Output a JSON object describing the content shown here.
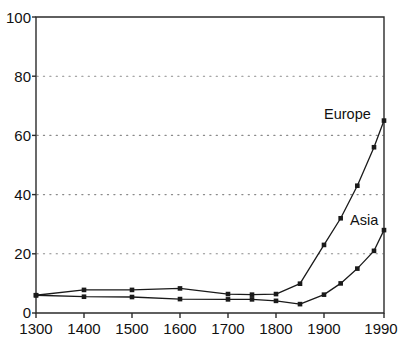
{
  "chart_data": {
    "type": "line",
    "title": "",
    "subtitle": "",
    "xlabel": "",
    "ylabel": "",
    "xlim": [
      1300,
      1990
    ],
    "ylim": [
      0,
      100
    ],
    "grid": "horizontal-dotted",
    "gridlines_y": [
      20,
      40,
      60,
      80
    ],
    "legend_position": "inline-right-end-of-line",
    "xticks": [
      1300,
      1400,
      1500,
      1600,
      1700,
      1800,
      1900,
      1990
    ],
    "xticklabels": [
      "1300",
      "1400",
      "1500",
      "1600",
      "1700",
      "1800",
      "1900",
      "1990"
    ],
    "yticks": [
      0,
      20,
      40,
      60,
      80,
      100
    ],
    "yticklabels": [
      "0",
      "20",
      "40",
      "60",
      "80",
      "100"
    ],
    "annotations": [
      {
        "text": "Europe",
        "x": 1963,
        "y": 66
      },
      {
        "text": "Asia",
        "x": 1962,
        "y": 31
      }
    ],
    "series": [
      {
        "name": "Europe",
        "color": "#1a1a1a",
        "marker": "filled-square",
        "x": [
          1300,
          1400,
          1500,
          1600,
          1700,
          1750,
          1800,
          1850,
          1900,
          1925,
          1950,
          1975,
          1990
        ],
        "values": [
          6.0,
          7.8,
          7.8,
          8.3,
          6.4,
          6.2,
          6.4,
          9.9,
          23.0,
          32.0,
          43.0,
          56.0,
          65.0
        ]
      },
      {
        "name": "Asia",
        "color": "#1a1a1a",
        "marker": "filled-square",
        "x": [
          1300,
          1400,
          1500,
          1600,
          1700,
          1750,
          1800,
          1850,
          1900,
          1925,
          1950,
          1975,
          1990
        ],
        "values": [
          6.0,
          5.5,
          5.4,
          4.7,
          4.6,
          4.6,
          4.1,
          3.0,
          6.2,
          10.0,
          15.0,
          21.0,
          28.0
        ]
      }
    ]
  },
  "axis": {
    "y_tick_0": "0",
    "y_tick_20": "20",
    "y_tick_40": "40",
    "y_tick_60": "60",
    "y_tick_80": "80",
    "y_tick_100": "100",
    "x_tick_1300": "1300",
    "x_tick_1400": "1400",
    "x_tick_1500": "1500",
    "x_tick_1600": "1600",
    "x_tick_1700": "1700",
    "x_tick_1800": "1800",
    "x_tick_1900": "1900",
    "x_tick_1990": "1990"
  },
  "labels": {
    "europe": "Europe",
    "asia": "Asia"
  },
  "colors": {
    "line": "#1a1a1a",
    "frame": "#2b2b2b",
    "grid": "#8a8a8a",
    "background": "#ffffff",
    "text": "#111111"
  }
}
